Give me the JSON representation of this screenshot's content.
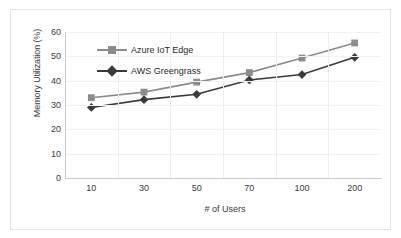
{
  "chart_data": {
    "type": "line",
    "title": "",
    "xlabel": "# of Users",
    "ylabel": "Memory Utilization (%)",
    "categories": [
      "10",
      "30",
      "50",
      "70",
      "100",
      "200"
    ],
    "ylim": [
      0,
      60
    ],
    "yticks": [
      "0",
      "10",
      "20",
      "30",
      "40",
      "50",
      "60"
    ],
    "grid": "vertical-and-horizontal-faint",
    "legend_position": "inside-top-left",
    "series": [
      {
        "name": "Azure IoT Edge",
        "marker": "square",
        "color": "#8c8c8c",
        "values": [
          33,
          35.3,
          39.4,
          43.3,
          49.3,
          55.5
        ]
      },
      {
        "name": "AWS Greengrass",
        "marker": "diamond",
        "color": "#3b3b3b",
        "values": [
          29,
          32.2,
          34.4,
          40.3,
          42.5,
          49.6
        ]
      }
    ]
  }
}
